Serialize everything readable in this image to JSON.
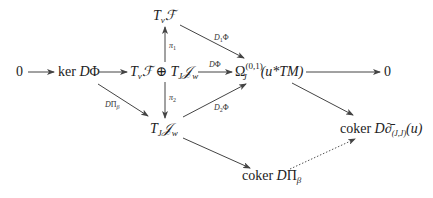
{
  "diagram": {
    "type": "commutative-diagram",
    "nodes": {
      "zero_left": "0",
      "ker": "ker DΦ",
      "top": "Tᵥℱ",
      "center": "Tᵥℱ ⊕ Tⱼ𝒥ᵥᵥ",
      "bottom": "Tⱼ𝒥w",
      "omega": "Ωⱼ⁽⁰˒¹⁾(u*TM)",
      "zero_right": "0",
      "coker_dbar": "coker D∂̄₍ⱼ,ⱼ₎(u)",
      "coker_dpi": "coker DΠβ"
    },
    "labels": {
      "pi1": "π1",
      "pi2": "π2",
      "d1phi": "D₁Φ",
      "dphi": "DΦ",
      "d2phi": "D₂Φ",
      "dpibeta": "DΠβ"
    },
    "text": {
      "zero": "0",
      "ker": "ker",
      "D": "D",
      "Phi": "Φ",
      "T": "T",
      "v": "v",
      "F": "ℱ",
      "oplus": "⊕",
      "J": "J",
      "Jscr": "𝒥",
      "w": "w",
      "Omega": "Ω",
      "omega_sup": "(0,1)",
      "omega_arg": "(u*TM)",
      "coker": "coker",
      "Pi": "Π",
      "beta": "β",
      "dbar": "∂̄",
      "dbar_sub": "(J,J)",
      "u_arg": "(u)",
      "pi": "π",
      "one": "1",
      "two": "2",
      "D1": "D",
      "sub1": "1",
      "sub2": "2"
    }
  }
}
